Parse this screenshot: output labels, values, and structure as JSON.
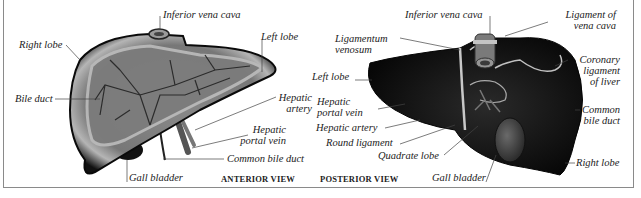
{
  "figure": {
    "colors": {
      "background": "#ffffff",
      "frame": "#8a8a8a",
      "liver_dark": "#0b0b0b",
      "liver_mid": "#6e6e6e",
      "liver_light": "#b0b0b0",
      "leader_line": "#444444"
    },
    "anterior_view": {
      "caption": "ANTERIOR VIEW",
      "labels": {
        "inferior_vena_cava": "Inferior vena cava",
        "right_lobe": "Right lobe",
        "left_lobe": "Left lobe",
        "bile_duct": "Bile duct",
        "hepatic_artery_1": "Hepatic",
        "hepatic_artery_2": "artery",
        "hepatic_portal_vein_1": "Hepatic",
        "hepatic_portal_vein_2": "portal vein",
        "common_bile_duct": "Common bile duct",
        "gall_bladder": "Gall bladder"
      }
    },
    "posterior_view": {
      "caption": "POSTERIOR VIEW",
      "labels": {
        "inferior_vena_cava": "Inferior vena cava",
        "ligament_of_vena_cava_1": "Ligament of",
        "ligament_of_vena_cava_2": "vena cava",
        "ligamentum_venosum_1": "Ligamentum",
        "ligamentum_venosum_2": "venosum",
        "left_lobe": "Left lobe",
        "coronary_ligament_1": "Coronary",
        "coronary_ligament_2": "ligament",
        "coronary_ligament_3": "of liver",
        "hepatic_portal_vein_1": "Hepatic",
        "hepatic_portal_vein_2": "portal vein",
        "common_bile_duct_1": "Common",
        "common_bile_duct_2": "bile duct",
        "hepatic_artery": "Hepatic artery",
        "round_ligament": "Round ligament",
        "quadrate_lobe": "Quadrate lobe",
        "right_lobe": "Right lobe",
        "gall_bladder": "Gall bladder"
      }
    }
  }
}
